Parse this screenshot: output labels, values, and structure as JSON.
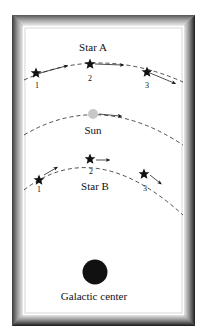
{
  "labels": {
    "star_a": "Star A",
    "star_b": "Star B",
    "sun": "Sun",
    "galactic_center": "Galactic center"
  },
  "star_a_positions": [
    "1",
    "2",
    "3"
  ],
  "star_b_positions": [
    "1",
    "2",
    "3"
  ],
  "colors": {
    "frame_dark": "#2a2a2a",
    "frame_light": "#d8d8d8",
    "background": "#ffffff",
    "star": "#111111",
    "sun": "#c8c8c8",
    "galactic_center": "#111111"
  }
}
